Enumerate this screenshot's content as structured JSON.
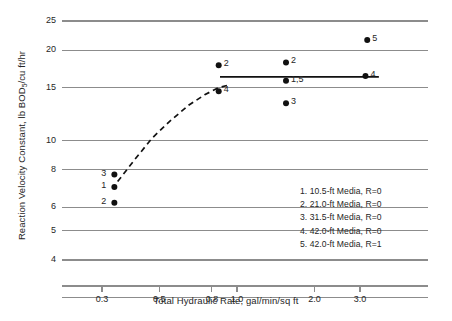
{
  "chart_data": {
    "type": "scatter",
    "title": "",
    "xlabel": "Total Hydraulic Rate, gal/min/sq ft",
    "ylabel": "Reaction Velocity Constant, lb BOD5/cu ft/hr",
    "ylabel_prefix": "Reaction Velocity Constant, lb BOD",
    "ylabel_sub": "5",
    "ylabel_suffix": "/cu ft/hr",
    "xscale": "log",
    "yscale": "log",
    "xlim": [
      0.25,
      4.0
    ],
    "ylim": [
      3.0,
      27.0
    ],
    "grid": "horizontal",
    "legend_position": "inside-lower-right",
    "xticks": [
      {
        "value": 0.3,
        "label": "0.3"
      },
      {
        "value": 0.5,
        "label": "0.5"
      },
      {
        "value": 0.8,
        "label": "0.8"
      },
      {
        "value": 1.0,
        "label": "1.0"
      },
      {
        "value": 2.0,
        "label": "2.0"
      },
      {
        "value": 3.0,
        "label": "3.0"
      }
    ],
    "yticks": [
      {
        "value": 25,
        "label": "25"
      },
      {
        "value": 20,
        "label": "20"
      },
      {
        "value": 15,
        "label": "15"
      },
      {
        "value": 10,
        "label": "10"
      },
      {
        "value": 8,
        "label": "8"
      },
      {
        "value": 6,
        "label": "6"
      },
      {
        "value": 5,
        "label": "5"
      },
      {
        "value": 4,
        "label": "4"
      },
      {
        "value": 3,
        "label": ""
      }
    ],
    "points": [
      {
        "x": 0.335,
        "y": 7.7,
        "label": "3",
        "label_side": "left"
      },
      {
        "x": 0.335,
        "y": 7.0,
        "label": "1",
        "label_side": "left"
      },
      {
        "x": 0.335,
        "y": 6.2,
        "label": "2",
        "label_side": "left"
      },
      {
        "x": 0.85,
        "y": 17.8,
        "label": "2",
        "label_side": "right"
      },
      {
        "x": 0.85,
        "y": 14.6,
        "label": "4",
        "label_side": "right"
      },
      {
        "x": 1.55,
        "y": 18.2,
        "label": "2",
        "label_side": "right"
      },
      {
        "x": 1.55,
        "y": 15.8,
        "label": "1,5",
        "label_side": "right"
      },
      {
        "x": 1.55,
        "y": 13.3,
        "label": "3",
        "label_side": "right"
      },
      {
        "x": 3.2,
        "y": 21.6,
        "label": "5",
        "label_side": "right"
      },
      {
        "x": 3.15,
        "y": 16.4,
        "label": "4",
        "label_side": "right"
      }
    ],
    "curves": [
      {
        "name": "trend-dashed",
        "style": "dashed",
        "points": [
          {
            "x": 0.345,
            "y": 7.3
          },
          {
            "x": 0.4,
            "y": 8.6
          },
          {
            "x": 0.47,
            "y": 10.2
          },
          {
            "x": 0.55,
            "y": 11.6
          },
          {
            "x": 0.65,
            "y": 13.1
          },
          {
            "x": 0.75,
            "y": 14.2
          },
          {
            "x": 0.85,
            "y": 15.0
          },
          {
            "x": 0.93,
            "y": 15.3
          }
        ]
      },
      {
        "name": "plateau-solid",
        "style": "solid",
        "points": [
          {
            "x": 0.86,
            "y": 16.3
          },
          {
            "x": 3.55,
            "y": 16.3
          }
        ]
      }
    ],
    "legend": [
      {
        "key": "1",
        "text": "1.  10.5-ft Media, R=0"
      },
      {
        "key": "2",
        "text": "2.  21.0-ft Media, R=0"
      },
      {
        "key": "3",
        "text": "3.  31.5-ft Media, R=0"
      },
      {
        "key": "4",
        "text": "4.  42.0-ft Media, R=0"
      },
      {
        "key": "5",
        "text": "5.  42.0-ft Media, R=1"
      }
    ],
    "colors": {
      "axis": "#8c8c8c",
      "grid": "#8c8c8c",
      "marker": "#111111",
      "text": "#262626",
      "background": "#ffffff"
    }
  }
}
